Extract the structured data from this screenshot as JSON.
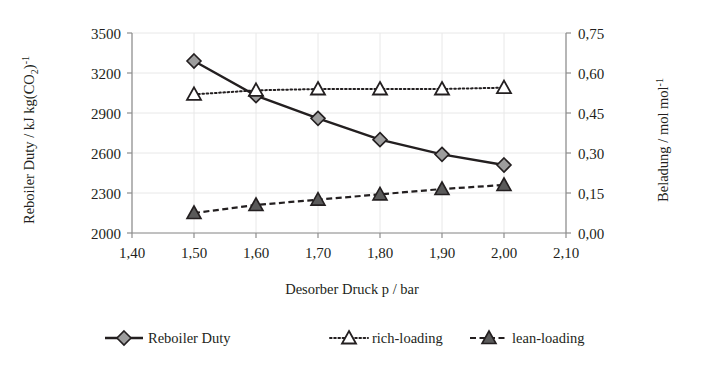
{
  "chart_data": {
    "type": "line",
    "title": "",
    "xlabel": "Desorber Druck p / bar",
    "ylabel": "Reboiler Duty / kJ kg(CO2)-1",
    "y2label": "Beladung / mol mol-1",
    "x": [
      1.5,
      1.6,
      1.7,
      1.8,
      1.9,
      2.0
    ],
    "xlim": [
      1.4,
      2.1
    ],
    "ylim": [
      2000,
      3500
    ],
    "y2lim": [
      0.0,
      0.75
    ],
    "xticks": [
      "1,40",
      "1,50",
      "1,60",
      "1,70",
      "1,80",
      "1,90",
      "2,00",
      "2,10"
    ],
    "xtick_values": [
      1.4,
      1.5,
      1.6,
      1.7,
      1.8,
      1.9,
      2.0,
      2.1
    ],
    "yticks": [
      "2000",
      "2300",
      "2600",
      "2900",
      "3200",
      "3500"
    ],
    "ytick_values": [
      2000,
      2300,
      2600,
      2900,
      3200,
      3500
    ],
    "y2ticks": [
      "0,00",
      "0,15",
      "0,30",
      "0,45",
      "0,60",
      "0,75"
    ],
    "y2tick_values": [
      0.0,
      0.15,
      0.3,
      0.45,
      0.6,
      0.75
    ],
    "grid": true,
    "legend_position": "bottom",
    "series": [
      {
        "name": "Reboiler Duty",
        "axis": "left",
        "marker": "diamond",
        "linestyle": "solid",
        "values": [
          3290,
          3030,
          2860,
          2700,
          2590,
          2510
        ]
      },
      {
        "name": "rich-loading",
        "axis": "right",
        "marker": "triangle-open",
        "linestyle": "dotted",
        "values": [
          0.52,
          0.535,
          0.54,
          0.54,
          0.54,
          0.545
        ]
      },
      {
        "name": "lean-loading",
        "axis": "right",
        "marker": "triangle-filled",
        "linestyle": "dashed",
        "values": [
          0.075,
          0.105,
          0.125,
          0.145,
          0.165,
          0.18
        ]
      }
    ]
  },
  "labels": {
    "y_axis_main": "Reboiler Duty / kJ kg(CO",
    "y_axis_sub": "2",
    "y_axis_tail": ")",
    "y_axis_sup": "-1",
    "y2_axis_main": "Beladung / mol mol",
    "y2_axis_sup": "-1",
    "x_axis": "Desorber Druck p / bar"
  },
  "legend": {
    "items": [
      {
        "label": "Reboiler Duty"
      },
      {
        "label": "rich-loading"
      },
      {
        "label": "lean-loading"
      }
    ]
  },
  "colors": {
    "line": "#231f20",
    "grid": "#e8e8e8",
    "axis": "#8d8d8d",
    "diamond_fill": "#9d9d9d",
    "triangle_fill": "#5a5a5a",
    "background": "#ffffff"
  }
}
